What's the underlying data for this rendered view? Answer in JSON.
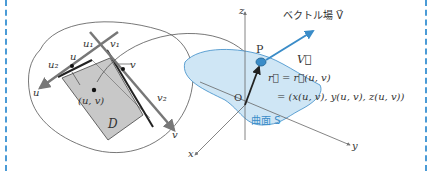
{
  "diagram": {
    "region_labels": {
      "u1": "u₁",
      "v1": "v₁",
      "u2": "u₂",
      "v2": "v₂",
      "u": "u",
      "v": "v",
      "point": "(u, v)",
      "domain": "D",
      "u_axis": "u",
      "v_axis": "v"
    },
    "axes": {
      "x": "x",
      "y": "y",
      "z": "z",
      "origin": "O"
    },
    "point_P": "P",
    "vector_field_label": "ベクトル場 V⃗",
    "vector_label": "V⃗",
    "r_eq1": "r⃗ = r⃗(u, v)",
    "r_eq2": "= (x(u, v), y(u, v), z(u, v))",
    "surface_label": "曲面 S"
  },
  "colors": {
    "frame": "#4a9bd6",
    "surface": "#cfe6f5",
    "accent": "#3a8cc8",
    "domain_fill": "#c8c8c8"
  }
}
